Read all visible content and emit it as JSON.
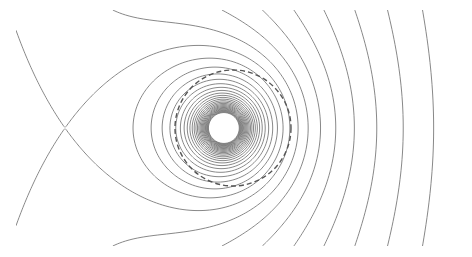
{
  "figure": {
    "width": 472,
    "height": 257,
    "background": "#ffffff",
    "line_color": "#7a7a7a",
    "dashed_circle_color": "#555555"
  },
  "field": {
    "source_center": [
      224,
      128
    ],
    "uniform_field_direction": "+x",
    "saddle_point": [
      65,
      128
    ],
    "plot_region": {
      "x0": 16,
      "y0": 10,
      "x1": 457,
      "y1": 246
    },
    "contour_count_hint": 90
  },
  "dashed_circle": {
    "center": [
      233,
      128
    ],
    "radius": 58
  }
}
